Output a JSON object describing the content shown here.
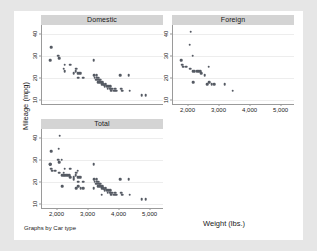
{
  "figure": {
    "note": "Graphs by Car type",
    "ylabel": "Mileage (mpg)",
    "xlabel": "Weight (lbs.)",
    "panel_titles": {
      "domestic": "Domestic",
      "foreign": "Foreign",
      "total": "Total"
    },
    "colors": {
      "page_background": "#e6e6e6",
      "canvas_background": "#ffffff",
      "panel_title_background": "#d4d4d4",
      "marker": "#555a63",
      "axis_line": "#9a9a9a",
      "gridline": "#ededed"
    }
  },
  "chart_data": {
    "type": "scatter",
    "title": "",
    "xlabel": "Weight (lbs.)",
    "ylabel": "Mileage (mpg)",
    "note": "Graphs by Car type",
    "grid": "horizontal",
    "legend": "none",
    "xlim": [
      1500,
      5400
    ],
    "ylim": [
      8,
      44
    ],
    "xticks": [
      2000,
      3000,
      4000,
      5000
    ],
    "xticklabels": [
      "2,000",
      "3,000",
      "4,000",
      "5,000"
    ],
    "yticks": [
      10,
      20,
      30,
      40
    ],
    "yticklabels": [
      "10",
      "20",
      "30",
      "40"
    ],
    "panels": [
      {
        "name": "Domestic",
        "n": 52,
        "points": [
          [
            1800,
            34
          ],
          [
            1760,
            28
          ],
          [
            2020,
            30
          ],
          [
            2050,
            29
          ],
          [
            2230,
            26
          ],
          [
            2200,
            24
          ],
          [
            2230,
            23
          ],
          [
            2410,
            26
          ],
          [
            2520,
            22
          ],
          [
            2580,
            23
          ],
          [
            2600,
            24
          ],
          [
            2650,
            22
          ],
          [
            2690,
            22
          ],
          [
            2670,
            20
          ],
          [
            2750,
            22
          ],
          [
            2830,
            20
          ],
          [
            3170,
            28
          ],
          [
            3180,
            21
          ],
          [
            3200,
            20
          ],
          [
            3250,
            19
          ],
          [
            3260,
            21
          ],
          [
            3280,
            20
          ],
          [
            3300,
            19
          ],
          [
            3310,
            18
          ],
          [
            3330,
            20
          ],
          [
            3350,
            19
          ],
          [
            3360,
            18
          ],
          [
            3370,
            19
          ],
          [
            3400,
            18
          ],
          [
            3420,
            17
          ],
          [
            3450,
            18
          ],
          [
            3470,
            17
          ],
          [
            3490,
            17
          ],
          [
            3520,
            16
          ],
          [
            3550,
            17
          ],
          [
            3600,
            16
          ],
          [
            3620,
            15
          ],
          [
            3650,
            16
          ],
          [
            3690,
            15
          ],
          [
            3700,
            16
          ],
          [
            3730,
            15
          ],
          [
            3740,
            14
          ],
          [
            3780,
            15
          ],
          [
            3830,
            14
          ],
          [
            3850,
            15
          ],
          [
            3900,
            14
          ],
          [
            4030,
            21
          ],
          [
            4060,
            15
          ],
          [
            4080,
            14
          ],
          [
            4290,
            21
          ],
          [
            4330,
            14
          ],
          [
            4720,
            12
          ],
          [
            4840,
            12
          ]
        ]
      },
      {
        "name": "Foreign",
        "n": 22,
        "points": [
          [
            2070,
            41
          ],
          [
            2040,
            35
          ],
          [
            2130,
            30
          ],
          [
            1760,
            28
          ],
          [
            1800,
            26
          ],
          [
            1830,
            25
          ],
          [
            1930,
            25
          ],
          [
            2050,
            24
          ],
          [
            2160,
            23
          ],
          [
            2200,
            23
          ],
          [
            2280,
            23
          ],
          [
            2330,
            23
          ],
          [
            2370,
            23
          ],
          [
            2400,
            22
          ],
          [
            2160,
            18
          ],
          [
            2520,
            21
          ],
          [
            2600,
            17
          ],
          [
            2650,
            25
          ],
          [
            2670,
            18
          ],
          [
            2750,
            17
          ],
          [
            2830,
            17
          ],
          [
            3170,
            17
          ],
          [
            3420,
            14
          ]
        ]
      },
      {
        "name": "Total",
        "n": 74,
        "points": [
          [
            1800,
            34
          ],
          [
            1760,
            28
          ],
          [
            2020,
            30
          ],
          [
            2050,
            29
          ],
          [
            2230,
            26
          ],
          [
            2200,
            24
          ],
          [
            2230,
            23
          ],
          [
            2410,
            26
          ],
          [
            2520,
            22
          ],
          [
            2580,
            23
          ],
          [
            2600,
            24
          ],
          [
            2650,
            22
          ],
          [
            2690,
            22
          ],
          [
            2670,
            20
          ],
          [
            2750,
            22
          ],
          [
            2830,
            20
          ],
          [
            3170,
            28
          ],
          [
            3180,
            21
          ],
          [
            3200,
            20
          ],
          [
            3250,
            19
          ],
          [
            3260,
            21
          ],
          [
            3280,
            20
          ],
          [
            3300,
            19
          ],
          [
            3310,
            18
          ],
          [
            3330,
            20
          ],
          [
            3350,
            19
          ],
          [
            3360,
            18
          ],
          [
            3370,
            19
          ],
          [
            3400,
            18
          ],
          [
            3420,
            17
          ],
          [
            3450,
            18
          ],
          [
            3470,
            17
          ],
          [
            3490,
            17
          ],
          [
            3520,
            16
          ],
          [
            3550,
            17
          ],
          [
            3600,
            16
          ],
          [
            3620,
            15
          ],
          [
            3650,
            16
          ],
          [
            3690,
            15
          ],
          [
            3700,
            16
          ],
          [
            3730,
            15
          ],
          [
            3740,
            14
          ],
          [
            3780,
            15
          ],
          [
            3830,
            14
          ],
          [
            3850,
            15
          ],
          [
            3900,
            14
          ],
          [
            4030,
            21
          ],
          [
            4060,
            15
          ],
          [
            4080,
            14
          ],
          [
            4290,
            21
          ],
          [
            4330,
            14
          ],
          [
            4720,
            12
          ],
          [
            4840,
            12
          ],
          [
            2070,
            41
          ],
          [
            2040,
            35
          ],
          [
            2130,
            30
          ],
          [
            1760,
            28
          ],
          [
            1800,
            26
          ],
          [
            1830,
            25
          ],
          [
            1930,
            25
          ],
          [
            2050,
            24
          ],
          [
            2160,
            23
          ],
          [
            2200,
            23
          ],
          [
            2280,
            23
          ],
          [
            2330,
            23
          ],
          [
            2370,
            23
          ],
          [
            2400,
            22
          ],
          [
            2160,
            18
          ],
          [
            2520,
            21
          ],
          [
            2600,
            17
          ],
          [
            2650,
            25
          ],
          [
            2670,
            18
          ],
          [
            2750,
            17
          ],
          [
            2830,
            17
          ],
          [
            3170,
            17
          ],
          [
            3420,
            14
          ]
        ]
      }
    ]
  }
}
